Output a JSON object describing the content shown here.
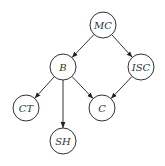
{
  "diagram": {
    "type": "directed-graph",
    "nodes": [
      {
        "id": "MC",
        "label": "MC",
        "x": 103,
        "y": 25
      },
      {
        "id": "B",
        "label": "B",
        "x": 63,
        "y": 67
      },
      {
        "id": "ISC",
        "label": "ISC",
        "x": 141,
        "y": 67
      },
      {
        "id": "CT",
        "label": "CT",
        "x": 26,
        "y": 108
      },
      {
        "id": "C",
        "label": "C",
        "x": 102,
        "y": 108
      },
      {
        "id": "SH",
        "label": "SH",
        "x": 63,
        "y": 141
      }
    ],
    "edges": [
      {
        "from": "MC",
        "to": "B"
      },
      {
        "from": "MC",
        "to": "ISC"
      },
      {
        "from": "B",
        "to": "CT"
      },
      {
        "from": "B",
        "to": "SH"
      },
      {
        "from": "B",
        "to": "C"
      },
      {
        "from": "ISC",
        "to": "C"
      }
    ],
    "colors": {
      "stroke": "#333333",
      "fill": "#ffffff"
    }
  }
}
